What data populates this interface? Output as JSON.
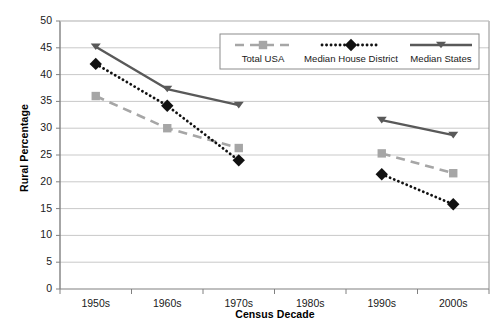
{
  "chart_data": {
    "type": "line",
    "title": "",
    "xlabel": "Census Decade",
    "ylabel": "Rural Percentage",
    "categories": [
      "1950s",
      "1960s",
      "1970s",
      "1980s",
      "1990s",
      "2000s"
    ],
    "ylim": [
      0,
      50
    ],
    "ytick_labels": [
      "0",
      "5",
      "10",
      "15",
      "20",
      "25",
      "30",
      "35",
      "40",
      "45",
      "50"
    ],
    "ytick_values": [
      0,
      5,
      10,
      15,
      20,
      25,
      30,
      35,
      40,
      45,
      50
    ],
    "grid": "horizontal",
    "legend_position": "top-center-inside",
    "series": [
      {
        "name": "Total USA",
        "color": "#a6a6a6",
        "line_style": "dashed",
        "marker": "square",
        "values": [
          36.0,
          30.0,
          26.3,
          null,
          25.3,
          21.6
        ]
      },
      {
        "name": "Median House District",
        "color": "#111111",
        "line_style": "dotted",
        "marker": "diamond",
        "values": [
          42.0,
          34.2,
          24.0,
          null,
          21.4,
          15.8
        ]
      },
      {
        "name": "Median States",
        "color": "#595959",
        "line_style": "solid",
        "marker": "triangle-down",
        "values": [
          45.2,
          37.3,
          34.3,
          null,
          31.5,
          28.7
        ]
      }
    ]
  },
  "legend": {
    "items": [
      {
        "label": "Total USA"
      },
      {
        "label": "Median House District"
      },
      {
        "label": "Median States"
      }
    ]
  },
  "colors": {
    "total_usa": "#a6a6a6",
    "median_house_district": "#111111",
    "median_states": "#595959",
    "grid": "#c9c9c9",
    "axis": "#808080",
    "plot_border": "#8c8c8c"
  }
}
